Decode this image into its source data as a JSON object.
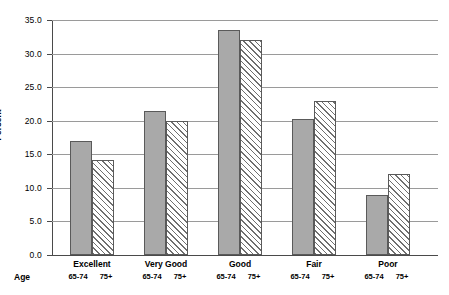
{
  "chart_data": {
    "type": "bar",
    "title": "",
    "xlabel": "Age",
    "ylabel": "Percent",
    "ylim": [
      0.0,
      35.0
    ],
    "ytick_labels": [
      "0.0",
      "5.0",
      "10.0",
      "15.0",
      "20.0",
      "25.0",
      "30.0",
      "35.0"
    ],
    "ytick_values": [
      0.0,
      5.0,
      10.0,
      15.0,
      20.0,
      25.0,
      30.0,
      35.0
    ],
    "grid": true,
    "legend_position": "none",
    "categories": [
      "Excellent",
      "Very Good",
      "Good",
      "Fair",
      "Poor"
    ],
    "group_sublabels": [
      "65-74",
      "75+"
    ],
    "series": [
      {
        "name": "65-74",
        "style": "solid-gray",
        "values": [
          17.0,
          21.4,
          33.5,
          20.2,
          9.0
        ]
      },
      {
        "name": "75+",
        "style": "diagonal-hatch",
        "values": [
          14.2,
          20.0,
          32.0,
          23.0,
          12.0
        ]
      }
    ]
  },
  "colors": {
    "solid_bar": "#a9a9a9",
    "bar_border": "#5a5a5a",
    "gridline": "#9a9a9a",
    "axis": "#4a4a4a",
    "background": "#ffffff"
  }
}
